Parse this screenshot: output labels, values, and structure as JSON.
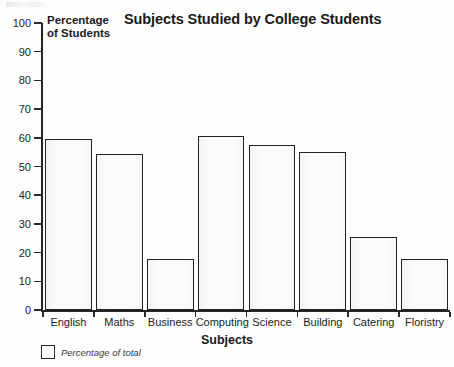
{
  "chart_data": {
    "type": "bar",
    "title": "Subjects Studied by College Students",
    "xlabel": "Subjects",
    "ylabel": "Percentage of Students",
    "categories": [
      "English",
      "Maths",
      "Business",
      "Computing",
      "Science",
      "Building",
      "Catering",
      "Floristry"
    ],
    "values": [
      59.5,
      54.5,
      17.8,
      60.5,
      57.5,
      55,
      25.5,
      17.8
    ],
    "ylim": [
      0,
      100
    ],
    "ytick_step": 10,
    "yticks": [
      100,
      90,
      80,
      70,
      60,
      50,
      40,
      30,
      20,
      10,
      0
    ],
    "grid": false,
    "legend_position": "below-axis-left",
    "legend": [
      {
        "label": "Percentage of total",
        "swatch": "hollow-box"
      }
    ],
    "series": [
      {
        "name": "Percentage of total",
        "values": [
          59.5,
          54.5,
          17.8,
          60.5,
          57.5,
          55,
          25.5,
          17.8
        ]
      }
    ]
  },
  "colors": {
    "bar_fill": "#fbfbfb",
    "bar_outline": "#232323",
    "axis": "#242424",
    "text": "#1a1a1a",
    "background": "#fdfdfd"
  },
  "ylabel_lines": [
    "Percentage",
    "of Students"
  ]
}
